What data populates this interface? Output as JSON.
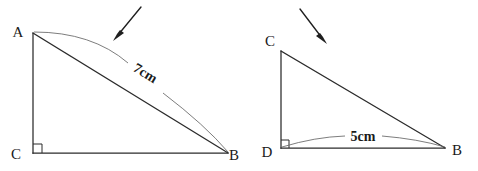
{
  "figure": {
    "background_color": "#ffffff",
    "line_color": "#2b2b2b",
    "arc_color": "#666666",
    "arrow_color": "#1f1f1f",
    "label_color": "#1a1a1a"
  },
  "figures": [
    {
      "id": "left-triangle",
      "name": "triangle-ACB",
      "vertices": [
        {
          "name": "A",
          "label": "A",
          "x": 33,
          "y": 33,
          "label_x": 18,
          "label_y": 37
        },
        {
          "name": "C",
          "label": "C",
          "x": 33,
          "y": 153,
          "label_x": 16,
          "label_y": 159
        },
        {
          "name": "B",
          "label": "B",
          "x": 228,
          "y": 153,
          "label_x": 232,
          "label_y": 160
        }
      ],
      "right_angle_at": "C",
      "measurement": {
        "label": "7cm",
        "value": 7,
        "unit": "cm",
        "side": "AB",
        "rotation_deg": 31,
        "label_x": 143,
        "label_y": 77
      },
      "pointer": {
        "name": "arrow-to-hypotenuse",
        "from_x": 141,
        "from_y": 7,
        "to_x": 114,
        "to_y": 40
      }
    },
    {
      "id": "right-triangle",
      "name": "triangle-CDB",
      "vertices": [
        {
          "name": "C",
          "label": "C",
          "x": 281,
          "y": 51,
          "label_x": 266,
          "label_y": 46
        },
        {
          "name": "D",
          "label": "D",
          "x": 281,
          "y": 148,
          "label_x": 263,
          "label_y": 156
        },
        {
          "name": "B",
          "label": "B",
          "x": 445,
          "y": 148,
          "label_x": 450,
          "label_y": 155
        }
      ],
      "right_angle_at": "D",
      "measurement": {
        "label": "5cm",
        "value": 5,
        "unit": "cm",
        "side": "DB",
        "rotation_deg": 0,
        "label_x": 363,
        "label_y": 141
      },
      "pointer": {
        "name": "arrow-to-base",
        "from_x": 300,
        "from_y": 9,
        "to_x": 326,
        "to_y": 43
      }
    }
  ]
}
